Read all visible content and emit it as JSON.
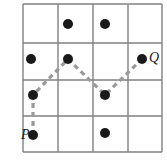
{
  "figure": {
    "width": 167,
    "height": 164,
    "background_color": "#ffffff"
  },
  "grid": {
    "name": "square-lattice-grid",
    "rows": 4,
    "columns": 4,
    "line_color": "#808080",
    "line_width": 1.4,
    "left": 23,
    "top": 4,
    "right": 162,
    "bottom": 152,
    "x_lines": [
      23,
      58,
      93,
      128,
      162
    ],
    "y_lines": [
      4,
      43,
      80,
      116,
      152
    ]
  },
  "dots": {
    "color": "#1a1a1a",
    "radius": 5,
    "items": [
      {
        "id": "dot-top-b",
        "x": 68,
        "y": 24,
        "label": ""
      },
      {
        "id": "dot-top-c",
        "x": 105,
        "y": 24,
        "label": ""
      },
      {
        "id": "dot-left-upper",
        "x": 31,
        "y": 59,
        "label": ""
      },
      {
        "id": "dot-peak",
        "x": 68,
        "y": 59,
        "label": ""
      },
      {
        "id": "dot-q",
        "x": 142,
        "y": 59,
        "label": "Q"
      },
      {
        "id": "dot-left-mid",
        "x": 33,
        "y": 95,
        "label": ""
      },
      {
        "id": "dot-valley",
        "x": 105,
        "y": 95,
        "label": ""
      },
      {
        "id": "dot-p",
        "x": 33,
        "y": 135,
        "label": "P"
      },
      {
        "id": "dot-bottom-c",
        "x": 105,
        "y": 133,
        "label": ""
      }
    ]
  },
  "path": {
    "name": "dashed-zigzag-path",
    "color": "#9a9a9a",
    "stroke_width": 3.2,
    "dash_pattern": "5 4",
    "vertices": [
      {
        "x": 33,
        "y": 135
      },
      {
        "x": 33,
        "y": 95
      },
      {
        "x": 68,
        "y": 59
      },
      {
        "x": 105,
        "y": 95
      },
      {
        "x": 142,
        "y": 59
      }
    ]
  },
  "labels": [
    {
      "id": "label-p",
      "text": "P",
      "x": 21,
      "y": 128
    },
    {
      "id": "label-q",
      "text": "Q",
      "x": 149,
      "y": 51
    }
  ],
  "chart_data": {
    "type": "scatter",
    "xlabel": "",
    "ylabel": "",
    "xlim": [
      0,
      4
    ],
    "ylim": [
      0,
      4
    ],
    "grid": true,
    "legend": "none",
    "lattice_points": [
      {
        "name": "P",
        "col": 0,
        "row": 0
      },
      {
        "name": "",
        "col": 0,
        "row": 1
      },
      {
        "name": "",
        "col": 0,
        "row": 2
      },
      {
        "name": "",
        "col": 2,
        "row": 0
      },
      {
        "name": "",
        "col": 1,
        "row": 2
      },
      {
        "name": "",
        "col": 1,
        "row": 3
      },
      {
        "name": "",
        "col": 2,
        "row": 3
      },
      {
        "name": "",
        "col": 2,
        "row": 1
      },
      {
        "name": "Q",
        "col": 3,
        "row": 2
      }
    ],
    "series": [
      {
        "name": "path",
        "style": "dashed",
        "points": [
          {
            "col": 0,
            "row": 0
          },
          {
            "col": 0,
            "row": 1
          },
          {
            "col": 1,
            "row": 2
          },
          {
            "col": 2,
            "row": 1
          },
          {
            "col": 3,
            "row": 2
          }
        ]
      }
    ]
  }
}
